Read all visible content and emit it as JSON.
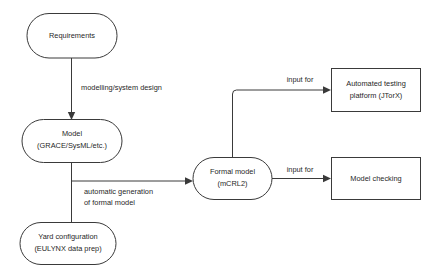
{
  "diagram": {
    "background_color": "#ffffff",
    "stroke_color": "#3a3a3a",
    "text_color": "#1f1f1f",
    "nodes": [
      {
        "id": "requirements",
        "shape": "rounded-rectangle",
        "lines": [
          "Requirements"
        ],
        "line1": "Requirements",
        "line2": ""
      },
      {
        "id": "model",
        "shape": "rounded-rectangle",
        "lines": [
          "Model",
          "(GRACE/SysML/etc.)"
        ],
        "line1": "Model",
        "line2": "(GRACE/SysML/etc.)"
      },
      {
        "id": "yard-configuration",
        "shape": "rounded-rectangle",
        "lines": [
          "Yard configuration",
          "(EULYNX data prep)"
        ],
        "line1": "Yard configuration",
        "line2": "(EULYNX data prep)"
      },
      {
        "id": "formal-model",
        "shape": "rounded-rectangle",
        "lines": [
          "Formal model",
          "(mCRL2)"
        ],
        "line1": "Formal model",
        "line2": "(mCRL2)"
      },
      {
        "id": "automated-testing-platform",
        "shape": "rectangle",
        "lines": [
          "Automated testing",
          "platform (JTorX)"
        ],
        "line1": "Automated testing",
        "line2": "platform (JTorX)"
      },
      {
        "id": "model-checking",
        "shape": "rectangle",
        "lines": [
          "Model checking"
        ],
        "line1": "Model checking",
        "line2": ""
      }
    ],
    "edges": [
      {
        "id": "requirements-to-model",
        "from": "requirements",
        "to": "model",
        "label_line1": "modelling/system design",
        "label_line2": "",
        "arrow": true
      },
      {
        "id": "model-to-formal-model",
        "from": "model",
        "to": "formal-model",
        "label_line1": "automatic generation",
        "label_line2": "of formal model",
        "arrow": true
      },
      {
        "id": "model-to-yard-configuration",
        "from": "model",
        "to": "yard-configuration",
        "label_line1": "",
        "label_line2": "",
        "arrow": false
      },
      {
        "id": "formal-model-to-automated-testing",
        "from": "formal-model",
        "to": "automated-testing-platform",
        "label_line1": "input for",
        "label_line2": "",
        "arrow": true
      },
      {
        "id": "formal-model-to-model-checking",
        "from": "formal-model",
        "to": "model-checking",
        "label_line1": "input for",
        "label_line2": "",
        "arrow": true
      }
    ]
  }
}
